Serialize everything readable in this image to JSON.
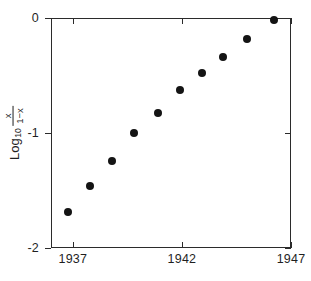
{
  "chart_data": {
    "type": "scatter",
    "title": "",
    "xlabel": "",
    "ylabel": "Log10 [ x / (1-x) ]",
    "ylabel_parts": {
      "log_text": "Log",
      "log_subscript": "10",
      "numerator": "x",
      "denominator": "1−x"
    },
    "xlim": [
      1936.0,
      1947.0
    ],
    "ylim": [
      -2,
      0
    ],
    "grid": false,
    "legend": null,
    "xticks": [
      1937,
      1942,
      1947
    ],
    "xtick_labels": [
      "1937",
      "1942",
      "1947"
    ],
    "yticks": [
      0,
      -1,
      -2
    ],
    "ytick_labels": [
      "0",
      "-1",
      "-2"
    ],
    "marker": "filled-circle",
    "marker_color": "#141414",
    "x": [
      1936.8,
      1937.8,
      1938.8,
      1939.8,
      1940.9,
      1941.9,
      1942.9,
      1943.9,
      1945.0,
      1946.2
    ],
    "y": [
      -1.69,
      -1.46,
      -1.24,
      -1.0,
      -0.83,
      -0.63,
      -0.48,
      -0.34,
      -0.18,
      -0.02
    ],
    "points": [
      {
        "x": 1936.8,
        "y": -1.69
      },
      {
        "x": 1937.8,
        "y": -1.46
      },
      {
        "x": 1938.8,
        "y": -1.24
      },
      {
        "x": 1939.8,
        "y": -1.0
      },
      {
        "x": 1940.9,
        "y": -0.83
      },
      {
        "x": 1941.9,
        "y": -0.63
      },
      {
        "x": 1942.9,
        "y": -0.48
      },
      {
        "x": 1943.9,
        "y": -0.34
      },
      {
        "x": 1945.0,
        "y": -0.18
      },
      {
        "x": 1946.2,
        "y": -0.02
      }
    ]
  },
  "axes": {
    "frame_color": "#2b2b2b",
    "background": "#ffffff"
  }
}
